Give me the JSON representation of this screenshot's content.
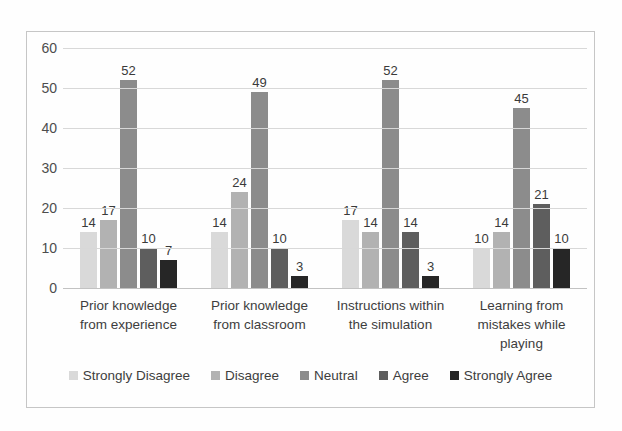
{
  "chart_data": {
    "type": "bar",
    "title": "",
    "xlabel": "",
    "ylabel": "",
    "categories": [
      "Prior knowledge from experience",
      "Prior knowledge from classroom",
      "Instructions within the simulation",
      "Learning from mistakes while playing"
    ],
    "series": [
      {
        "name": "Strongly Disagree",
        "color": "#d9d9d9",
        "values": [
          14,
          14,
          17,
          10
        ]
      },
      {
        "name": "Disagree",
        "color": "#b2b2b2",
        "values": [
          17,
          24,
          14,
          14
        ]
      },
      {
        "name": "Neutral",
        "color": "#8c8c8c",
        "values": [
          52,
          49,
          52,
          45
        ]
      },
      {
        "name": "Agree",
        "color": "#5e5e5e",
        "values": [
          10,
          10,
          14,
          21
        ]
      },
      {
        "name": "Strongly Agree",
        "color": "#262626",
        "values": [
          7,
          3,
          3,
          10
        ]
      }
    ],
    "ylim": [
      0,
      60
    ],
    "yticks": [
      0,
      10,
      20,
      30,
      40,
      50,
      60
    ],
    "grid": true,
    "data_labels": true,
    "legend_position": "bottom"
  },
  "style": {
    "border_color": "#c6c6c6",
    "gridline_color": "#d8d8d8",
    "axis_text_color": "#4d4d4d",
    "label_text_color": "#3a3a3a",
    "background": "#fefefe"
  }
}
